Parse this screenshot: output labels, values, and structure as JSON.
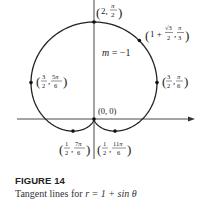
{
  "figure": {
    "title": "FIGURE 14",
    "caption_prefix": "Tangent lines for ",
    "caption_equation": "r = 1 + sin θ"
  },
  "diagram": {
    "curve": "r = 1 + sin θ (cardioid)",
    "axes": {
      "horizontal": "polar axis with arrow",
      "vertical": "line θ = π/2"
    },
    "points": [
      {
        "label": "(2, π/2)",
        "r": "2",
        "theta": "π/2"
      },
      {
        "label": "(1 + √3/2, π/3)",
        "r": "1 + √3/2",
        "theta": "π/3"
      },
      {
        "label": "(3/2, π/6)",
        "r": "3/2",
        "theta": "π/6"
      },
      {
        "label": "(3/2, 5π/6)",
        "r": "3/2",
        "theta": "5π/6"
      },
      {
        "label": "(0, 0)",
        "r": "0",
        "theta": ""
      },
      {
        "label": "(1/2, 7π/6)",
        "r": "1/2",
        "theta": "7π/6"
      },
      {
        "label": "(1/2, 11π/6)",
        "r": "1/2",
        "theta": "11π/6"
      }
    ],
    "annotation": "m = −1"
  }
}
